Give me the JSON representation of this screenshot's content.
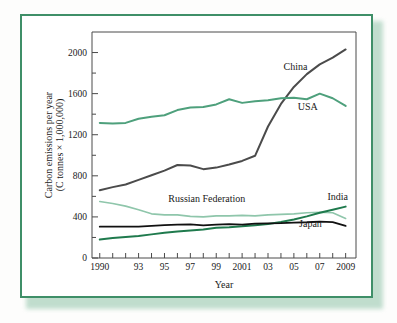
{
  "figure": {
    "frame_color": "#3f8f68",
    "shadow_color": "#8fc3a8",
    "background": "#ffffff"
  },
  "chart_data": {
    "type": "line",
    "title": "",
    "xlabel": "Year",
    "ylabel_line1": "Carbon emissions per year",
    "ylabel_line2": "(C tonnes × 1,000,000)",
    "x": [
      1990,
      1991,
      1992,
      1993,
      1994,
      1995,
      1996,
      1997,
      1998,
      1999,
      2000,
      2001,
      2002,
      2003,
      2004,
      2005,
      2006,
      2007,
      2008,
      2009
    ],
    "xlim": [
      1989.4,
      2009.8
    ],
    "ylim": [
      0,
      2200
    ],
    "xtick_values": [
      1990,
      1991,
      1992,
      1993,
      1994,
      1995,
      1996,
      1997,
      1998,
      1999,
      2000,
      2001,
      2002,
      2003,
      2004,
      2005,
      2006,
      2007,
      2008,
      2009
    ],
    "xtick_labels": [
      "1990",
      "",
      "",
      "93",
      "",
      "95",
      "",
      "97",
      "",
      "99",
      "",
      "2001",
      "",
      "03",
      "",
      "05",
      "",
      "07",
      "",
      "2009"
    ],
    "ytick_values": [
      0,
      200,
      400,
      600,
      800,
      1000,
      1200,
      1400,
      1600,
      1800,
      2000
    ],
    "ytick_labels": [
      "0",
      "",
      "400",
      "",
      "800",
      "",
      "1200",
      "",
      "1600",
      "",
      "2000"
    ],
    "grid": false,
    "legend_position": "inline-labels",
    "series": [
      {
        "name": "China",
        "color": "#4b4b4b",
        "width": 2.0,
        "label_x": 2004.2,
        "label_y": 1830,
        "values": [
          660,
          690,
          715,
          760,
          805,
          850,
          905,
          900,
          865,
          880,
          910,
          945,
          995,
          1280,
          1500,
          1665,
          1790,
          1885,
          1950,
          2030
        ]
      },
      {
        "name": "USA",
        "color": "#4ea07c",
        "width": 2.0,
        "label_x": 2005.3,
        "label_y": 1440,
        "values": [
          1315,
          1310,
          1315,
          1355,
          1375,
          1390,
          1440,
          1465,
          1470,
          1495,
          1545,
          1510,
          1525,
          1535,
          1555,
          1560,
          1545,
          1600,
          1555,
          1480
        ]
      },
      {
        "name": "Russian Federation",
        "color": "#8fc6ab",
        "width": 1.6,
        "label_x": 1995.3,
        "label_y": 545,
        "values": [
          550,
          530,
          505,
          470,
          430,
          420,
          420,
          405,
          400,
          410,
          410,
          415,
          410,
          420,
          425,
          430,
          440,
          445,
          440,
          385
        ]
      },
      {
        "name": "India",
        "color": "#1f7a4d",
        "width": 2.0,
        "label_x": 2007.6,
        "label_y": 560,
        "values": [
          180,
          195,
          205,
          215,
          230,
          245,
          258,
          268,
          278,
          295,
          300,
          308,
          320,
          330,
          350,
          375,
          405,
          440,
          470,
          500
        ]
      },
      {
        "name": "Japan",
        "color": "#111111",
        "width": 1.8,
        "label_x": 2005.4,
        "label_y": 300,
        "values": [
          305,
          305,
          305,
          305,
          312,
          320,
          325,
          328,
          318,
          325,
          330,
          325,
          335,
          338,
          340,
          345,
          348,
          355,
          350,
          312
        ]
      }
    ]
  }
}
